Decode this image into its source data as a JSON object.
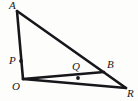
{
  "figure": {
    "type": "geometry-diagram",
    "background_color": "#fdfdfc",
    "stroke_color": "#17171b",
    "label_color": "#16161a",
    "canvas": {
      "width": 138,
      "height": 101
    },
    "points": {
      "A": {
        "label": "A",
        "x": 17,
        "y": 11,
        "label_x": 9,
        "label_y": 0,
        "marked": false
      },
      "O": {
        "label": "O",
        "x": 23,
        "y": 79,
        "label_x": 12,
        "label_y": 81,
        "marked": false
      },
      "R": {
        "label": "R",
        "x": 126,
        "y": 88,
        "label_x": 127,
        "label_y": 88,
        "marked": false
      },
      "B": {
        "label": "B",
        "x": 104,
        "y": 72,
        "label_x": 107,
        "label_y": 59,
        "marked": false
      },
      "P": {
        "label": "P",
        "x": 21,
        "y": 61,
        "label_x": 9,
        "label_y": 55,
        "marked": true
      },
      "Q": {
        "label": "Q",
        "x": 78,
        "y": 78,
        "label_x": 72,
        "label_y": 61,
        "marked": true
      }
    },
    "segments": [
      {
        "name": "segment-AO",
        "from": "A",
        "to": "O",
        "width": 2.6
      },
      {
        "name": "segment-AR",
        "from": "A",
        "to": "R",
        "width": 2.6
      },
      {
        "name": "segment-OR",
        "from": "O",
        "to": "R",
        "width": 2.6
      },
      {
        "name": "segment-OB",
        "from": "O",
        "to": "B",
        "width": 2.6
      }
    ]
  }
}
